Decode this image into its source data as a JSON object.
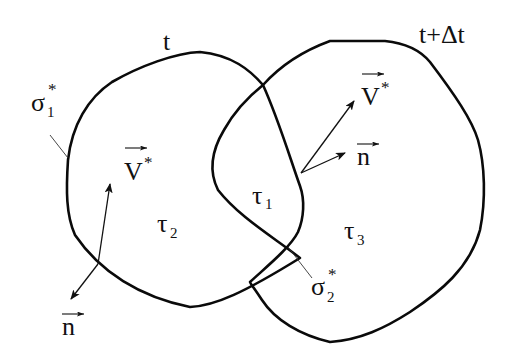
{
  "diagram": {
    "contours": [
      {
        "id": "contour-t",
        "label": "t"
      },
      {
        "id": "contour-t-plus-dt",
        "label": "t+Δt"
      }
    ],
    "labels": {
      "time_t": "t",
      "time_t_dt": "t+Δt",
      "sigma1": {
        "base": "σ",
        "sub": "1",
        "sup": "*"
      },
      "sigma2": {
        "base": "σ",
        "sub": "2",
        "sup": "*"
      },
      "tau1": {
        "base": "τ",
        "sub": "1"
      },
      "tau2": {
        "base": "τ",
        "sub": "2"
      },
      "tau3": {
        "base": "τ",
        "sub": "3"
      },
      "v_left": {
        "base": "V",
        "sup": "*"
      },
      "v_right": {
        "base": "V",
        "sup": "*"
      },
      "n_left": {
        "base": "n"
      },
      "n_right": {
        "base": "n"
      }
    },
    "colors": {
      "stroke": "#0a0a0a",
      "background": "#ffffff"
    }
  }
}
